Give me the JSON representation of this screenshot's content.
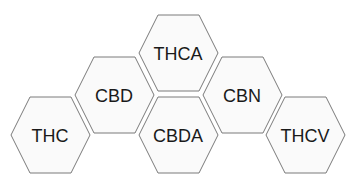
{
  "diagram": {
    "type": "hexagon-grid",
    "colors": {
      "fill": "#fafafa",
      "stroke": "#7a7a7a",
      "text": "#1a1a1a",
      "background": "#ffffff"
    },
    "hexagons": [
      {
        "label": "THC",
        "cx": 50,
        "cy": 135
      },
      {
        "label": "CBD",
        "cx": 114,
        "cy": 95
      },
      {
        "label": "THCA",
        "cx": 178,
        "cy": 53
      },
      {
        "label": "CBDA",
        "cx": 178,
        "cy": 135
      },
      {
        "label": "CBN",
        "cx": 242,
        "cy": 95
      },
      {
        "label": "THCV",
        "cx": 305,
        "cy": 135
      }
    ]
  }
}
